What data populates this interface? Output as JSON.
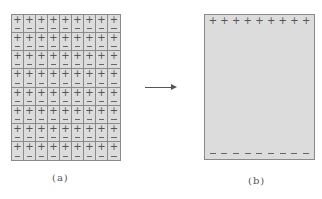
{
  "diagram": {
    "panel_a": {
      "label": "(a)",
      "rows": 8,
      "columns": 9,
      "cell_top_symbol": "+",
      "cell_bottom_symbol": "−",
      "description": "grid of polarized domains, each cell with + on top and − on bottom"
    },
    "arrow": {
      "direction": "right",
      "icon": "arrow-right-icon"
    },
    "panel_b": {
      "label": "(b)",
      "top_charges": [
        "+",
        "+",
        "+",
        "+",
        "+",
        "+",
        "+",
        "+",
        "+"
      ],
      "bottom_charges": [
        "−",
        "−",
        "−",
        "−",
        "−",
        "−",
        "−",
        "−",
        "−"
      ],
      "description": "net surface charge: + along top edge, − along bottom edge"
    },
    "colors": {
      "fill": "#dcdcdc",
      "border": "#8a8a8a",
      "symbol": "#555555"
    }
  }
}
